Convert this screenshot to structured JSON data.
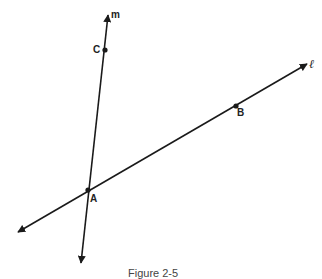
{
  "figure": {
    "caption": "Figure 2-5",
    "lines": [
      {
        "name": "m",
        "from": [
          81,
          263
        ],
        "to": [
          108,
          15
        ]
      },
      {
        "name": "ℓ",
        "from": [
          18,
          232
        ],
        "to": [
          307,
          64
        ]
      }
    ],
    "points": [
      {
        "name": "A",
        "x": 88,
        "y": 190
      },
      {
        "name": "B",
        "x": 236,
        "y": 106
      },
      {
        "name": "C",
        "x": 105,
        "y": 50
      }
    ],
    "labels": {
      "line_m": "m",
      "line_l": "ℓ",
      "point_a": "A",
      "point_b": "B",
      "point_c": "C"
    },
    "colors": {
      "stroke": "#1a1a1a",
      "background": "#ffffff"
    }
  }
}
